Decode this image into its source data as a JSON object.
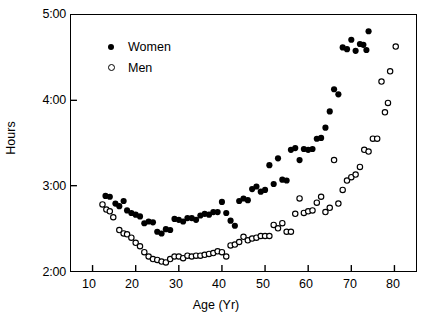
{
  "chart_data": {
    "type": "scatter",
    "title": "",
    "xlabel": "Age (Yr)",
    "ylabel": "Hours",
    "xlim": [
      5,
      85
    ],
    "ylim": [
      2,
      5
    ],
    "xticks": [
      10,
      20,
      30,
      40,
      50,
      60,
      70,
      80
    ],
    "xtick_labels": [
      "10",
      "20",
      "30",
      "40",
      "50",
      "60",
      "70",
      "80"
    ],
    "yticks": [
      2,
      3,
      4,
      5
    ],
    "ytick_labels": [
      "2:00",
      "3:00",
      "4:00",
      "5:00"
    ],
    "grid": false,
    "legend_position": "upper-left",
    "series": [
      {
        "name": "Women",
        "marker": "filled-circle",
        "color": "#000000",
        "points": [
          [
            13.0,
            2.88
          ],
          [
            14.0,
            2.87
          ],
          [
            15.3,
            2.79
          ],
          [
            16.2,
            2.76
          ],
          [
            17.2,
            2.82
          ],
          [
            18.0,
            2.71
          ],
          [
            19.0,
            2.68
          ],
          [
            20.0,
            2.66
          ],
          [
            21.0,
            2.64
          ],
          [
            22.0,
            2.56
          ],
          [
            23.0,
            2.58
          ],
          [
            24.0,
            2.57
          ],
          [
            25.0,
            2.46
          ],
          [
            26.0,
            2.44
          ],
          [
            27.0,
            2.49
          ],
          [
            28.0,
            2.48
          ],
          [
            29.0,
            2.61
          ],
          [
            30.0,
            2.6
          ],
          [
            31.0,
            2.58
          ],
          [
            32.0,
            2.62
          ],
          [
            33.0,
            2.62
          ],
          [
            34.0,
            2.6
          ],
          [
            35.0,
            2.65
          ],
          [
            36.0,
            2.67
          ],
          [
            37.0,
            2.66
          ],
          [
            38.0,
            2.69
          ],
          [
            39.0,
            2.69
          ],
          [
            40.0,
            2.81
          ],
          [
            41.0,
            2.68
          ],
          [
            42.0,
            2.59
          ],
          [
            43.0,
            2.53
          ],
          [
            44.0,
            2.82
          ],
          [
            45.0,
            2.85
          ],
          [
            46.0,
            2.83
          ],
          [
            47.0,
            2.96
          ],
          [
            48.0,
            2.99
          ],
          [
            49.0,
            2.93
          ],
          [
            50.0,
            2.95
          ],
          [
            51.0,
            3.24
          ],
          [
            52.0,
            3.02
          ],
          [
            53.0,
            3.32
          ],
          [
            54.0,
            3.07
          ],
          [
            55.0,
            3.06
          ],
          [
            56.0,
            3.42
          ],
          [
            57.0,
            3.44
          ],
          [
            58.0,
            3.3
          ],
          [
            59.0,
            3.43
          ],
          [
            60.0,
            3.42
          ],
          [
            61.0,
            3.43
          ],
          [
            62.0,
            3.55
          ],
          [
            63.0,
            3.56
          ],
          [
            64.0,
            3.68
          ],
          [
            65.0,
            3.87
          ],
          [
            66.0,
            4.13
          ],
          [
            67.0,
            4.07
          ],
          [
            68.0,
            4.62
          ],
          [
            69.0,
            4.6
          ],
          [
            70.0,
            4.71
          ],
          [
            71.0,
            4.58
          ],
          [
            72.0,
            4.66
          ],
          [
            72.8,
            4.65
          ],
          [
            73.5,
            4.59
          ],
          [
            74.0,
            4.81
          ]
        ]
      },
      {
        "name": "Men",
        "marker": "open-circle",
        "color": "#000000",
        "points": [
          [
            12.3,
            2.78
          ],
          [
            13.2,
            2.72
          ],
          [
            14.0,
            2.7
          ],
          [
            14.8,
            2.63
          ],
          [
            16.2,
            2.48
          ],
          [
            17.2,
            2.44
          ],
          [
            18.0,
            2.43
          ],
          [
            19.0,
            2.39
          ],
          [
            20.0,
            2.33
          ],
          [
            21.0,
            2.29
          ],
          [
            22.0,
            2.22
          ],
          [
            23.0,
            2.17
          ],
          [
            24.0,
            2.14
          ],
          [
            25.0,
            2.13
          ],
          [
            26.0,
            2.11
          ],
          [
            27.0,
            2.1
          ],
          [
            28.0,
            2.14
          ],
          [
            29.0,
            2.17
          ],
          [
            30.0,
            2.17
          ],
          [
            31.0,
            2.15
          ],
          [
            32.0,
            2.18
          ],
          [
            33.0,
            2.17
          ],
          [
            34.0,
            2.18
          ],
          [
            35.0,
            2.18
          ],
          [
            36.0,
            2.19
          ],
          [
            37.0,
            2.2
          ],
          [
            38.0,
            2.21
          ],
          [
            39.0,
            2.23
          ],
          [
            40.0,
            2.22
          ],
          [
            41.0,
            2.17
          ],
          [
            42.0,
            2.3
          ],
          [
            43.0,
            2.31
          ],
          [
            44.0,
            2.34
          ],
          [
            45.0,
            2.4
          ],
          [
            46.0,
            2.36
          ],
          [
            47.0,
            2.38
          ],
          [
            48.0,
            2.39
          ],
          [
            49.0,
            2.41
          ],
          [
            50.0,
            2.41
          ],
          [
            51.0,
            2.41
          ],
          [
            52.0,
            2.54
          ],
          [
            53.0,
            2.5
          ],
          [
            54.0,
            2.56
          ],
          [
            55.0,
            2.46
          ],
          [
            56.0,
            2.46
          ],
          [
            57.0,
            2.67
          ],
          [
            58.0,
            2.85
          ],
          [
            59.0,
            2.68
          ],
          [
            60.0,
            2.7
          ],
          [
            61.0,
            2.71
          ],
          [
            62.0,
            2.8
          ],
          [
            63.0,
            2.87
          ],
          [
            64.0,
            2.69
          ],
          [
            65.0,
            2.74
          ],
          [
            66.0,
            3.3
          ],
          [
            67.0,
            2.79
          ],
          [
            68.0,
            2.95
          ],
          [
            69.0,
            3.06
          ],
          [
            70.0,
            3.1
          ],
          [
            71.0,
            3.13
          ],
          [
            72.0,
            3.22
          ],
          [
            73.0,
            3.42
          ],
          [
            74.0,
            3.4
          ],
          [
            75.0,
            3.55
          ],
          [
            76.0,
            3.55
          ],
          [
            77.0,
            4.22
          ],
          [
            77.8,
            3.86
          ],
          [
            78.5,
            3.97
          ],
          [
            79.0,
            4.34
          ],
          [
            80.3,
            4.63
          ]
        ]
      }
    ]
  },
  "legend": {
    "items": [
      {
        "label": "Women",
        "marker": "filled-circle"
      },
      {
        "label": "Men",
        "marker": "open-circle"
      }
    ]
  },
  "axes": {
    "y_title": "Hours",
    "x_title": "Age (Yr)",
    "y_tick_labels": [
      "5:00",
      "4:00",
      "3:00",
      "2:00"
    ],
    "x_tick_labels": [
      "10",
      "20",
      "30",
      "40",
      "50",
      "60",
      "70",
      "80"
    ]
  }
}
